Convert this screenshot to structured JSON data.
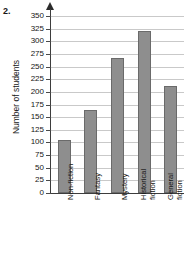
{
  "question_number": "2.",
  "chart_data": {
    "type": "bar",
    "title": "",
    "xlabel": "",
    "ylabel": "Number of students",
    "categories": [
      "Non-fiction",
      "Fantasy",
      "Mystery",
      "Historical fiction",
      "General fiction"
    ],
    "values": [
      105,
      165,
      267,
      320,
      212
    ],
    "ylim": [
      0,
      350
    ],
    "ytick_step": 25,
    "yticks": [
      0,
      25,
      50,
      75,
      100,
      125,
      150,
      175,
      200,
      225,
      250,
      275,
      300,
      325,
      350
    ],
    "ytick_labels": [
      "0",
      "25",
      "50",
      "75",
      "100",
      "125",
      "150",
      "175",
      "200",
      "225",
      "250",
      "275",
      "300",
      "325",
      "350"
    ],
    "grid": true,
    "legend": false,
    "bar_color": "#8e8e8e",
    "bar_edge_color": "#6a6a6a",
    "axis_color": "#3d3d3d",
    "gridline_color": "#c9c9c9"
  }
}
